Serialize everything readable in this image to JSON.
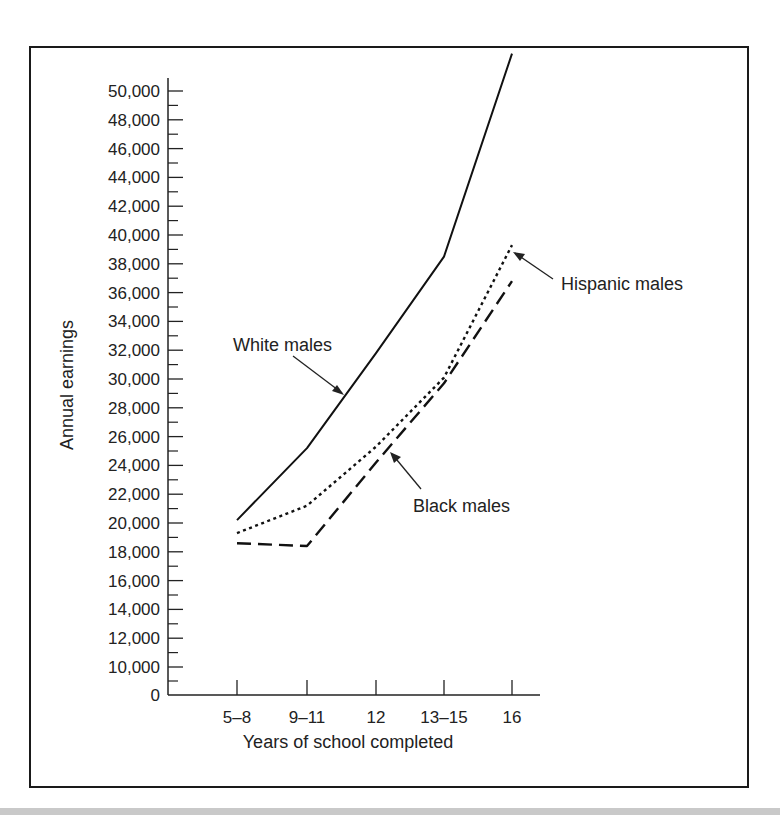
{
  "chart_data": {
    "type": "line",
    "title": "",
    "xlabel": "Years of school completed",
    "ylabel": "Annual earnings",
    "categories": [
      "5–8",
      "9–11",
      "12",
      "13–15",
      "16"
    ],
    "y_ticks": [
      "0",
      "10,000",
      "12,000",
      "14,000",
      "16,000",
      "18,000",
      "20,000",
      "22,000",
      "24,000",
      "26,000",
      "28,000",
      "30,000",
      "32,000",
      "34,000",
      "36,000",
      "38,000",
      "40,000",
      "42,000",
      "44,000",
      "46,000",
      "48,000",
      "50,000"
    ],
    "y_tick_values": [
      0,
      10000,
      12000,
      14000,
      16000,
      18000,
      20000,
      22000,
      24000,
      26000,
      28000,
      30000,
      32000,
      34000,
      36000,
      38000,
      40000,
      42000,
      44000,
      46000,
      48000,
      50000
    ],
    "ylim": [
      0,
      52600
    ],
    "axis_break": "between 0 and 10,000",
    "grid": false,
    "legend": "inline annotations with arrows",
    "series": [
      {
        "name": "White males",
        "style": "solid",
        "values": [
          20200,
          25200,
          31800,
          38500,
          52600
        ]
      },
      {
        "name": "Hispanic males",
        "style": "dotted",
        "values": [
          19300,
          21200,
          25300,
          30100,
          39300
        ]
      },
      {
        "name": "Black males",
        "style": "dashed",
        "values": [
          18600,
          18400,
          24200,
          29700,
          36800
        ]
      }
    ],
    "annotations": [
      {
        "text": "White males",
        "target_series": "White males"
      },
      {
        "text": "Hispanic males",
        "target_series": "Hispanic males"
      },
      {
        "text": "Black males",
        "target_series": "Black males"
      }
    ]
  },
  "colors": {
    "line": "#111111",
    "text": "#222222",
    "frame": "#1a1a1a",
    "band": "#c9c9c9"
  }
}
